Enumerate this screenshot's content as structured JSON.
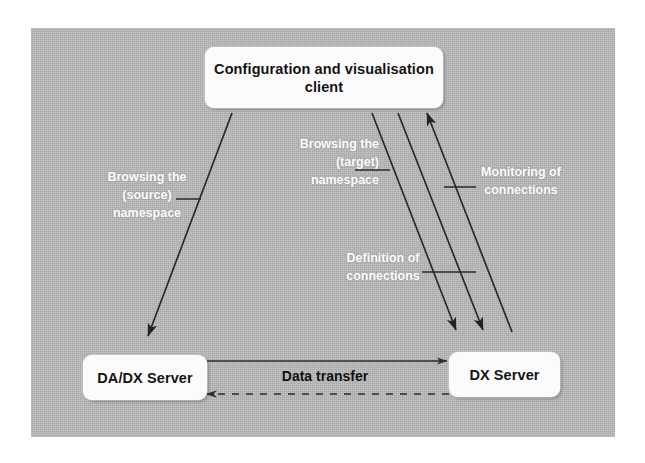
{
  "diagram": {
    "title_shown": false,
    "background_color": "#b9b9b9",
    "node_fill_color": "#fbfbfb",
    "node_text_color": "#141414",
    "edge_label_color": "#fdfdfd",
    "line_color": "#2b2b2b",
    "nodes": [
      {
        "id": "client",
        "label": "Configuration and\nvisualisation client"
      },
      {
        "id": "dadx",
        "label": "DA/DX Server"
      },
      {
        "id": "dx",
        "label": "DX Server"
      }
    ],
    "edge_labels": [
      {
        "id": "source",
        "label": "Browsing the\n(source)\nnamespace"
      },
      {
        "id": "target",
        "label": "Browsing the\n(target)\nnamespace"
      },
      {
        "id": "monitoring",
        "label": "Monitoring of\nconnections"
      },
      {
        "id": "definition",
        "label": "Definition of\nconnections"
      },
      {
        "id": "datatransfer",
        "label": "Data transfer"
      }
    ],
    "connections": [
      {
        "from": "client",
        "to": "dadx",
        "style": "solid",
        "arrow": "to",
        "label": "Browsing the (source) namespace"
      },
      {
        "from": "client",
        "to": "dx",
        "style": "solid",
        "arrow": "to",
        "label": "Browsing the (target) namespace"
      },
      {
        "from": "client",
        "to": "dx",
        "style": "solid",
        "arrow": "to",
        "label": "Definition of connections"
      },
      {
        "from": "dx",
        "to": "client",
        "style": "solid",
        "arrow": "to",
        "label": "Monitoring of connections"
      },
      {
        "from": "dadx",
        "to": "dx",
        "style": "solid",
        "arrow": "to",
        "label": "Data transfer"
      },
      {
        "from": "dx",
        "to": "dadx",
        "style": "dashed",
        "arrow": "to",
        "label": "Data transfer"
      }
    ]
  }
}
